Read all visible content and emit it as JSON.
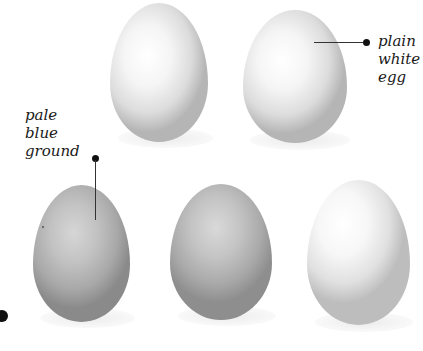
{
  "labels": {
    "plain_white_egg": [
      "plain",
      "white",
      "egg"
    ],
    "pale_blue_ground": [
      "pale",
      "blue",
      "ground"
    ]
  },
  "eggs": [
    {
      "name": "top-left-egg",
      "tone": "white"
    },
    {
      "name": "top-right-egg",
      "tone": "white"
    },
    {
      "name": "bottom-left-egg",
      "tone": "pale blue"
    },
    {
      "name": "bottom-middle-egg",
      "tone": "pale blue"
    },
    {
      "name": "bottom-right-egg",
      "tone": "white"
    }
  ]
}
